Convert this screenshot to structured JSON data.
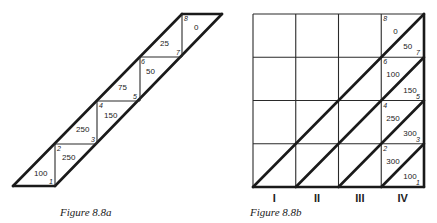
{
  "figure_a": {
    "caption": "Figure 8.8a",
    "nodes": [
      "1",
      "2",
      "3",
      "4",
      "5",
      "6",
      "7",
      "8"
    ],
    "values": [
      "100",
      "250",
      "250",
      "150",
      "75",
      "50",
      "25",
      "0"
    ]
  },
  "figure_b": {
    "caption": "Figure 8.8b",
    "columns": [
      "I",
      "II",
      "III",
      "IV"
    ],
    "rows": 4,
    "nodes": [
      "1",
      "2",
      "3",
      "4",
      "5",
      "6",
      "7",
      "8"
    ],
    "values": [
      "100",
      "300",
      "300",
      "250",
      "150",
      "100",
      "50",
      "0"
    ]
  }
}
